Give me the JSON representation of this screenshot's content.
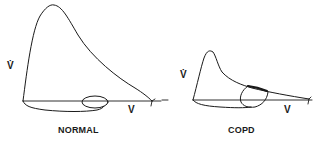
{
  "figure": {
    "panels": [
      {
        "id": "normal",
        "caption": "NORMAL",
        "y_axis_label": "V̇",
        "x_axis_label": "V",
        "description": "Normal flow-volume loop with tidal breathing loop small within maximal envelope"
      },
      {
        "id": "copd",
        "caption": "COPD",
        "y_axis_label": "V̇",
        "x_axis_label": "V",
        "description": "COPD flow-volume loop with scooped expiratory limb; tidal loop touches maximal expiratory curve (flow limitation)"
      }
    ],
    "colors": {
      "ink": "#1a1a1a",
      "background": "#ffffff"
    }
  }
}
